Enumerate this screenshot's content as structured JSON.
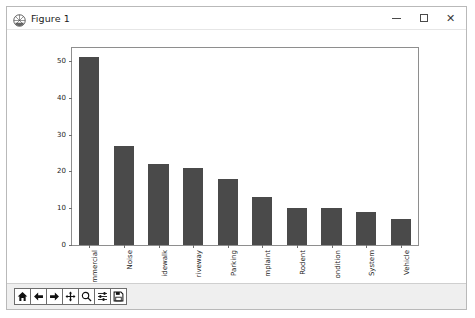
{
  "window": {
    "title": "Figure 1",
    "icon": "matplotlib-icon",
    "controls": {
      "minimize_label": "–",
      "maximize_label": "□",
      "close_label": "✕"
    }
  },
  "toolbar": {
    "buttons": [
      {
        "name": "home-button",
        "icon": "home-icon",
        "tooltip": "Reset original view"
      },
      {
        "name": "back-button",
        "icon": "arrow-left-icon",
        "tooltip": "Back to previous view"
      },
      {
        "name": "forward-button",
        "icon": "arrow-right-icon",
        "tooltip": "Forward to next view"
      },
      {
        "name": "pan-button",
        "icon": "move-cross-icon",
        "tooltip": "Pan axes with left mouse, zoom with right"
      },
      {
        "name": "zoom-button",
        "icon": "magnifier-icon",
        "tooltip": "Zoom to rectangle"
      },
      {
        "name": "configure-subplots-button",
        "icon": "sliders-icon",
        "tooltip": "Configure subplots"
      },
      {
        "name": "save-button",
        "icon": "floppy-disk-icon",
        "tooltip": "Save the figure"
      }
    ]
  },
  "chart_data": {
    "type": "bar",
    "title": "",
    "xlabel": "",
    "ylabel": "",
    "categories": [
      "mmercial",
      "Noise",
      "idewalk",
      "riveway",
      "Parking",
      "mplaint",
      "Rodent",
      "ondition",
      "System",
      "Vehicle"
    ],
    "values": [
      51,
      27,
      22,
      21,
      18,
      13,
      10,
      10,
      9,
      7
    ],
    "ylim": [
      0,
      53.5
    ],
    "yticks": [
      0,
      10,
      20,
      30,
      40,
      50
    ],
    "ytick_labels": [
      "0",
      "10",
      "20",
      "30",
      "40",
      "50"
    ],
    "grid": false,
    "legend": false,
    "bar_color": "#4a4a4a",
    "bar_width_ratio": 0.58,
    "xtick_rotation": -90
  }
}
